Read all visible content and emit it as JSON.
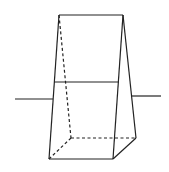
{
  "diagram": {
    "type": "geometry",
    "stroke_color": "#222222",
    "background": "#ffffff",
    "vertices": {
      "top_left": [
        59,
        15
      ],
      "top_right": [
        123,
        15
      ],
      "base_front_left": [
        49,
        159
      ],
      "base_front_right": [
        113,
        159
      ],
      "base_back_right": [
        136,
        138
      ],
      "base_back_left": [
        71,
        138
      ]
    },
    "solid_edges": [
      {
        "name": "top-edge",
        "from": [
          59,
          15
        ],
        "to": [
          123,
          15
        ]
      },
      {
        "name": "left-front-edge",
        "from": [
          59,
          15
        ],
        "to": [
          49,
          159
        ]
      },
      {
        "name": "right-front-edge",
        "from": [
          123,
          15
        ],
        "to": [
          113,
          159
        ]
      },
      {
        "name": "right-back-edge",
        "from": [
          123,
          15
        ],
        "to": [
          136,
          138
        ]
      },
      {
        "name": "base-front-edge",
        "from": [
          49,
          159
        ],
        "to": [
          113,
          159
        ]
      },
      {
        "name": "base-right-edge",
        "from": [
          113,
          159
        ],
        "to": [
          136,
          138
        ]
      },
      {
        "name": "section-line",
        "from": [
          54,
          82
        ],
        "to": [
          119,
          82
        ]
      },
      {
        "name": "outer-line-left",
        "from": [
          15,
          99
        ],
        "to": [
          53,
          99
        ]
      },
      {
        "name": "outer-line-right",
        "from": [
          131,
          96
        ],
        "to": [
          161,
          96
        ]
      }
    ],
    "dashed_edges": [
      {
        "name": "hidden-back-left-edge",
        "from": [
          59,
          15
        ],
        "to": [
          71,
          138
        ]
      },
      {
        "name": "hidden-base-back-edge",
        "from": [
          71,
          138
        ],
        "to": [
          136,
          138
        ]
      },
      {
        "name": "hidden-base-left-edge",
        "from": [
          71,
          138
        ],
        "to": [
          49,
          159
        ]
      }
    ]
  }
}
